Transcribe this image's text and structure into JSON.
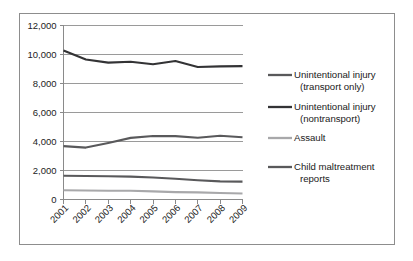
{
  "chart_data": {
    "type": "line",
    "title": "",
    "subtitle": "",
    "xlabel": "",
    "ylabel": "",
    "x": [
      "2001",
      "2002",
      "2003",
      "2004",
      "2005",
      "2006",
      "2007",
      "2008",
      "2009"
    ],
    "categories": [
      "2001",
      "2002",
      "2003",
      "2004",
      "2005",
      "2006",
      "2007",
      "2008",
      "2009"
    ],
    "ylim": [
      0,
      12000
    ],
    "ytick_step": 2000,
    "ytick_labels": [
      "12,000",
      "10,000",
      "8,000",
      "6,000",
      "4,000",
      "2,000",
      "0"
    ],
    "ytick_values": [
      12000,
      10000,
      8000,
      6000,
      4000,
      2000,
      0
    ],
    "grid": "horizontal",
    "legend_position": "right",
    "xtick_rotation": -45,
    "series": [
      {
        "name": "Unintentional injury (transport only)",
        "legend_label_line1": "Unintentional injury",
        "legend_label_line2": "(transport only)",
        "color": "#59595b",
        "width": 2.1,
        "values": [
          3680,
          3580,
          3900,
          4250,
          4380,
          4370,
          4260,
          4400,
          4290
        ]
      },
      {
        "name": "Unintentional injury (nontransport)",
        "legend_label_line1": "Unintentional injury",
        "legend_label_line2": "(nontransport)",
        "color": "#333335",
        "width": 2.1,
        "values": [
          10280,
          9650,
          9440,
          9500,
          9330,
          9550,
          9140,
          9180,
          9200
        ]
      },
      {
        "name": "Assault",
        "legend_label_line1": "Assault",
        "legend_label_line2": "",
        "color": "#a8a8aa",
        "width": 2.1,
        "values": [
          640,
          620,
          600,
          600,
          560,
          510,
          490,
          450,
          410
        ]
      },
      {
        "name": "Child maltreatment reports",
        "legend_label_line1": "Child maltreatment",
        "legend_label_line2": "reports",
        "color": "#59595b",
        "width": 2.1,
        "values": [
          1640,
          1620,
          1600,
          1580,
          1520,
          1430,
          1330,
          1250,
          1230
        ]
      }
    ]
  },
  "figure": {
    "border_color": "#8d8d8d",
    "background": "#ffffff",
    "grid_color": "#9a9a9a",
    "axis_color": "#8a8a8a"
  }
}
